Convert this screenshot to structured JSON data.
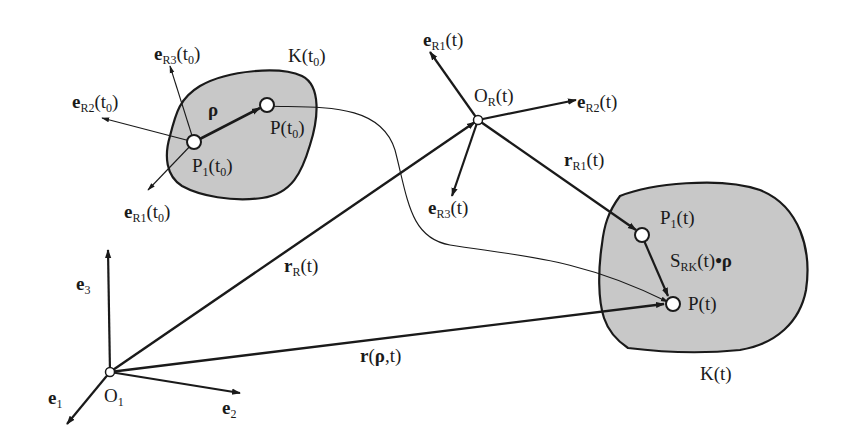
{
  "figure": {
    "type": "kinematics-diagram",
    "colors": {
      "ink": "#1a1a1a",
      "body_fill": "#c8c8c8",
      "background": "#ffffff",
      "point_fill": "#ffffff"
    }
  },
  "inertial_frame": {
    "origin": {
      "main": "O",
      "sub": "1"
    },
    "axes": [
      {
        "main": "e",
        "sub": "1"
      },
      {
        "main": "e",
        "sub": "2"
      },
      {
        "main": "e",
        "sub": "3"
      }
    ]
  },
  "body_t0": {
    "label": "K(t",
    "label_sub": "0",
    "label_close": ")",
    "reference_point": {
      "main": "P",
      "sub": "1",
      "arg": "(t",
      "arg_sub": "0",
      "close": ")"
    },
    "point": {
      "main": "P",
      "arg": "(t",
      "arg_sub": "0",
      "close": ")"
    },
    "relative_vector": "ρ",
    "axes": [
      {
        "main": "e",
        "sub": "R1",
        "arg": "(t",
        "arg_sub": "0",
        "close": ")"
      },
      {
        "main": "e",
        "sub": "R2",
        "arg": "(t",
        "arg_sub": "0",
        "close": ")"
      },
      {
        "main": "e",
        "sub": "R3",
        "arg": "(t",
        "arg_sub": "0",
        "close": ")"
      }
    ]
  },
  "reference_frame_t": {
    "origin": {
      "main": "O",
      "sub": "R",
      "arg": "(t)"
    },
    "axes": [
      {
        "main": "e",
        "sub": "R1",
        "arg": "(t)"
      },
      {
        "main": "e",
        "sub": "R2",
        "arg": "(t)"
      },
      {
        "main": "e",
        "sub": "R3",
        "arg": "(t)"
      }
    ]
  },
  "body_t": {
    "label": "K(t)",
    "reference_point": {
      "main": "P",
      "sub": "1",
      "arg": "(t)"
    },
    "point": {
      "main": "P",
      "arg": "(t)"
    },
    "rotated_vector": {
      "main": "S",
      "sub": "RK",
      "arg": "(t)",
      "dot": "•",
      "vec": "ρ"
    }
  },
  "vectors": {
    "r_R": {
      "main": "r",
      "sub": "R",
      "arg": "(t)"
    },
    "r_R1": {
      "main": "r",
      "sub": "R1",
      "arg": "(t)"
    },
    "r_rho": {
      "main": "r",
      "arg_open": "(",
      "vec": "ρ",
      "arg_rest": ",t)"
    }
  }
}
